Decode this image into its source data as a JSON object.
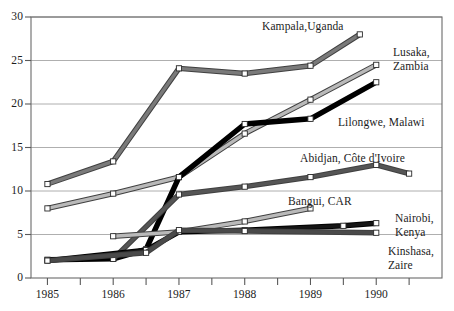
{
  "chart_data": {
    "type": "line",
    "title": "",
    "xlabel": "",
    "ylabel": "",
    "xlim": [
      1984.75,
      1991.0
    ],
    "ylim": [
      0,
      30
    ],
    "yticks": [
      "0",
      "5",
      "10",
      "15",
      "20",
      "25",
      "30"
    ],
    "ytick_values": [
      0,
      5,
      10,
      15,
      20,
      25,
      30
    ],
    "xticks": [
      "1985",
      "1986",
      "1987",
      "1988",
      "1989",
      "1990"
    ],
    "xtick_values": [
      1985,
      1986,
      1987,
      1988,
      1989,
      1990
    ],
    "minor_xticks": [
      1985.5,
      1986.5,
      1987.5,
      1988.5,
      1989.5,
      1990.5
    ],
    "grid": "horizontal",
    "legend": "inline-labels",
    "series": [
      {
        "name": "Kampala,Uganda",
        "style": "medium-gray",
        "color": "#7a7a7a",
        "x": [
          1985,
          1986,
          1987,
          1988,
          1989,
          1989.75
        ],
        "values": [
          10.8,
          13.4,
          24.1,
          23.5,
          24.4,
          28.0
        ],
        "label": "Kampala,Uganda",
        "label_x": 262,
        "label_y": 20
      },
      {
        "name": "Lusaka, Zambia",
        "style": "light-gray",
        "color": "#b9b9b9",
        "x": [
          1985,
          1986,
          1987,
          1988,
          1989,
          1990
        ],
        "values": [
          8.0,
          9.7,
          11.6,
          16.6,
          20.5,
          24.5
        ],
        "label": "Lusaka,\nZambia",
        "label_x": 393,
        "label_y": 46
      },
      {
        "name": "Lilongwe, Malawi",
        "style": "black",
        "color": "#000000",
        "x": [
          1985,
          1986,
          1986.5,
          1987,
          1988,
          1989,
          1990
        ],
        "values": [
          2.1,
          2.2,
          3.3,
          11.6,
          17.7,
          18.3,
          22.5
        ],
        "label": "Lilongwe, Malawi",
        "label_x": 338,
        "label_y": 116
      },
      {
        "name": "Abidjan, Côte d'Ivoire",
        "style": "dark-gray",
        "color": "#555555",
        "x": [
          1986,
          1987,
          1988,
          1989,
          1990,
          1990.5
        ],
        "values": [
          2.2,
          9.6,
          10.5,
          11.6,
          13.0,
          12.0
        ],
        "label": "Abidjan, Côte d'Ivoire",
        "label_x": 300,
        "label_y": 152
      },
      {
        "name": "Bangui, CAR",
        "style": "light-gray",
        "color": "#b9b9b9",
        "x": [
          1986,
          1987,
          1988,
          1989
        ],
        "values": [
          4.8,
          5.3,
          6.5,
          8.0
        ],
        "label": "Bangui, CAR",
        "label_x": 288,
        "label_y": 195
      },
      {
        "name": "Nairobi, Kenya",
        "style": "black",
        "color": "#151515",
        "x": [
          1985,
          1986.5,
          1987,
          1988,
          1989.5,
          1990
        ],
        "values": [
          2.0,
          3.2,
          5.3,
          5.5,
          6.0,
          6.3
        ],
        "label": "Nairobi,\nKenya",
        "label_x": 395,
        "label_y": 212
      },
      {
        "name": "Kinshasa, Zaire",
        "style": "dark-gray",
        "color": "#4a4a4a",
        "x": [
          1985,
          1986.5,
          1987,
          1988,
          1990
        ],
        "values": [
          2.0,
          2.9,
          5.5,
          5.4,
          5.2
        ],
        "label": "Kinshasa,\nZaire",
        "label_x": 388,
        "label_y": 245
      }
    ]
  }
}
